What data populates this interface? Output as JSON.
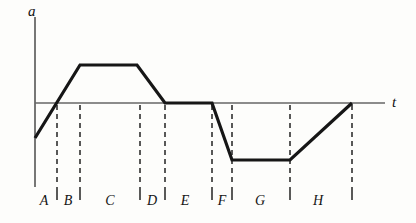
{
  "figure": {
    "title": "",
    "background_color": "#fdfdfb",
    "width": 416,
    "height": 223
  },
  "axes": {
    "vertical_axis_label": "a",
    "horizontal_axis_label": "t",
    "axis_color": "#555555",
    "origin_x": 35,
    "zero_line_y": 103,
    "vertical_axis_top": 17,
    "vertical_axis_bottom": 187,
    "horizontal_axis_right": 385
  },
  "curve": {
    "color": "#161616",
    "width": 3.2,
    "points": [
      [
        35,
        138
      ],
      [
        80,
        65
      ],
      [
        137,
        65
      ],
      [
        165,
        103
      ],
      [
        212,
        103
      ],
      [
        232,
        160
      ],
      [
        290,
        160
      ],
      [
        352,
        103
      ]
    ]
  },
  "dashed_guides": {
    "color": "#222222",
    "top_y": 105,
    "bottom_y": 183,
    "x_positions": [
      57,
      80,
      140,
      165,
      212,
      232,
      290,
      352
    ]
  },
  "interval_ticks": {
    "color": "#222222",
    "top_y": 187,
    "bottom_y": 200,
    "x_positions": [
      57,
      80,
      140,
      165,
      212,
      232,
      290,
      352
    ]
  },
  "interval_labels": [
    {
      "text": "A",
      "x": 44
    },
    {
      "text": "B",
      "x": 68
    },
    {
      "text": "C",
      "x": 110
    },
    {
      "text": "D",
      "x": 152
    },
    {
      "text": "E",
      "x": 185
    },
    {
      "text": "F",
      "x": 222
    },
    {
      "text": "G",
      "x": 260
    },
    {
      "text": "H",
      "x": 318
    }
  ],
  "chart_data": {
    "type": "line",
    "title": "",
    "xlabel": "t",
    "ylabel": "a",
    "grid": false,
    "legend": null,
    "xlim": [
      0,
      1
    ],
    "ylim": [
      -1,
      1
    ],
    "annotations": [
      "A",
      "B",
      "C",
      "D",
      "E",
      "F",
      "G",
      "H"
    ],
    "series": [
      {
        "name": "a(t)",
        "x": [
          0.0,
          0.128,
          0.291,
          0.371,
          0.505,
          0.562,
          0.729,
          0.906
        ],
        "y": [
          -0.5,
          0.75,
          0.75,
          0.0,
          0.0,
          -0.8,
          -0.8,
          0.0
        ],
        "points": [
          {
            "x": 0.0,
            "y": -0.5
          },
          {
            "x": 0.128,
            "y": 0.75
          },
          {
            "x": 0.291,
            "y": 0.75
          },
          {
            "x": 0.371,
            "y": 0.0
          },
          {
            "x": 0.505,
            "y": 0.0
          },
          {
            "x": 0.562,
            "y": -0.8
          },
          {
            "x": 0.729,
            "y": -0.8
          },
          {
            "x": 0.906,
            "y": 0.0
          }
        ]
      }
    ],
    "intervals": [
      {
        "label": "A",
        "x_start": 0.0,
        "x_end": 0.063,
        "behavior": "rising from negative a, crossing zero"
      },
      {
        "label": "B",
        "x_start": 0.063,
        "x_end": 0.128,
        "behavior": "rising to positive maximum"
      },
      {
        "label": "C",
        "x_start": 0.128,
        "x_end": 0.291,
        "behavior": "constant positive a"
      },
      {
        "label": "D",
        "x_start": 0.291,
        "x_end": 0.371,
        "behavior": "falling to zero"
      },
      {
        "label": "E",
        "x_start": 0.371,
        "x_end": 0.505,
        "behavior": "a equals zero"
      },
      {
        "label": "F",
        "x_start": 0.505,
        "x_end": 0.562,
        "behavior": "falling to negative minimum"
      },
      {
        "label": "G",
        "x_start": 0.562,
        "x_end": 0.729,
        "behavior": "constant negative a"
      },
      {
        "label": "H",
        "x_start": 0.729,
        "x_end": 0.906,
        "behavior": "rising back to zero"
      }
    ]
  }
}
